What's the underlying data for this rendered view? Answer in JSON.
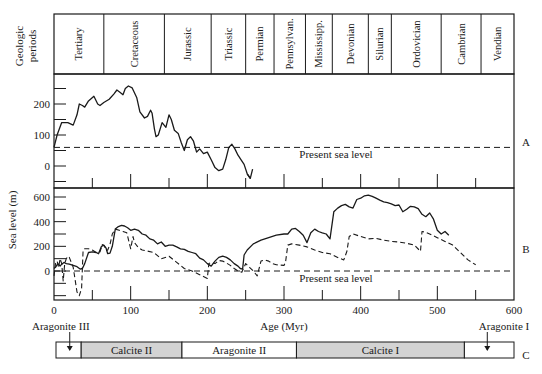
{
  "chart_data": {
    "type": "line",
    "title": "",
    "periods_header": {
      "label_line1": "Geologic",
      "label_line2": "periods",
      "periods": [
        {
          "name": "Tertiary",
          "start": 0,
          "end": 65
        },
        {
          "name": "Cretaceous",
          "start": 65,
          "end": 144
        },
        {
          "name": "Jurassic",
          "start": 144,
          "end": 205
        },
        {
          "name": "Triassic",
          "start": 205,
          "end": 250
        },
        {
          "name": "Permian",
          "start": 250,
          "end": 287
        },
        {
          "name": "Pennsylvan.",
          "start": 287,
          "end": 328
        },
        {
          "name": "Mississipp.",
          "start": 328,
          "end": 363
        },
        {
          "name": "Devonian",
          "start": 363,
          "end": 410
        },
        {
          "name": "Silurian",
          "start": 410,
          "end": 440
        },
        {
          "name": "Ordovician",
          "start": 440,
          "end": 505
        },
        {
          "name": "Cambrian",
          "start": 505,
          "end": 557
        },
        {
          "name": "Vendian",
          "start": 557,
          "end": 600
        }
      ]
    },
    "xlabel": "Age (Myr)",
    "xlim": [
      0,
      600
    ],
    "xticks": [
      0,
      100,
      200,
      300,
      400,
      500,
      600
    ],
    "ylabel": "Sea level (m)",
    "panels": [
      {
        "id": "A",
        "ylim": [
          -60,
          300
        ],
        "yticks": [
          0,
          100,
          200
        ],
        "reference_label": "Present sea level",
        "reference_value": 60,
        "series": [
          {
            "name": "Sea level A",
            "style": "solid",
            "x": [
              0,
              4,
              10,
              18,
              25,
              30,
              33,
              37,
              40,
              45,
              52,
              57,
              60,
              65,
              72,
              78,
              82,
              86,
              90,
              93,
              97,
              102,
              108,
              112,
              118,
              122,
              126,
              128,
              131,
              133,
              136,
              141,
              146,
              150,
              153,
              157,
              162,
              166,
              170,
              174,
              178,
              182,
              186,
              190,
              195,
              200,
              205,
              210,
              215,
              220,
              224,
              228,
              232,
              236,
              240,
              244,
              248,
              252,
              256
            ],
            "y": [
              60,
              100,
              140,
              140,
              132,
              165,
              200,
              195,
              190,
              210,
              225,
              200,
              195,
              205,
              215,
              232,
              245,
              238,
              230,
              250,
              258,
              252,
              220,
              175,
              155,
              160,
              180,
              170,
              120,
              95,
              100,
              140,
              125,
              165,
              150,
              115,
              105,
              75,
              50,
              85,
              95,
              80,
              45,
              55,
              40,
              45,
              20,
              -5,
              -15,
              -10,
              20,
              60,
              70,
              55,
              35,
              20,
              5,
              -25,
              -40
            ]
          }
        ],
        "tail": {
          "x": [
            252,
            256,
            259
          ],
          "y": [
            -25,
            -40,
            -10
          ]
        }
      },
      {
        "id": "B",
        "ylim": [
          -240,
          660
        ],
        "yticks": [
          0,
          200,
          400,
          600
        ],
        "reference_label": "Present sea level",
        "reference_value": 0,
        "series": [
          {
            "name": "Sea level B (solid)",
            "style": "solid",
            "x": [
              0,
              2,
              5,
              8,
              10,
              13,
              16,
              20,
              25,
              30,
              34,
              37,
              40,
              45,
              50,
              55,
              58,
              62,
              65,
              68,
              70,
              73,
              76,
              80,
              84,
              88,
              92,
              96,
              100,
              105,
              110,
              115,
              120,
              125,
              130,
              135,
              140,
              145,
              150,
              155,
              160,
              165,
              170,
              175,
              180,
              185,
              190,
              195,
              200,
              205,
              210,
              215,
              220,
              225,
              230,
              235,
              240,
              243,
              246,
              248,
              252,
              260,
              270,
              280,
              290,
              300,
              305,
              310,
              315,
              320,
              325,
              330,
              335,
              340,
              345,
              350,
              355,
              360,
              365,
              370,
              375,
              380,
              385,
              390,
              395,
              400,
              405,
              410,
              415,
              420,
              425,
              430,
              435,
              440,
              445,
              450,
              455,
              460,
              465,
              470,
              475,
              480,
              485,
              490,
              495,
              500,
              505,
              510,
              515,
              520,
              525,
              530,
              535,
              540,
              545,
              550
            ],
            "y": [
              20,
              30,
              60,
              40,
              55,
              70,
              60,
              55,
              45,
              35,
              15,
              20,
              60,
              150,
              155,
              150,
              140,
              200,
              210,
              185,
              140,
              145,
              200,
              340,
              360,
              370,
              365,
              350,
              330,
              340,
              330,
              300,
              290,
              260,
              250,
              220,
              235,
              200,
              210,
              210,
              195,
              180,
              175,
              160,
              150,
              140,
              105,
              90,
              60,
              40,
              80,
              110,
              120,
              110,
              90,
              60,
              40,
              20,
              15,
              130,
              170,
              220,
              250,
              270,
              290,
              300,
              300,
              340,
              345,
              320,
              290,
              230,
              310,
              340,
              320,
              310,
              300,
              260,
              480,
              510,
              530,
              540,
              520,
              510,
              580,
              590,
              610,
              615,
              605,
              590,
              575,
              560,
              555,
              545,
              530,
              535,
              480,
              500,
              525,
              520,
              505,
              460,
              440,
              470,
              420,
              330,
              300,
              320,
              290
            ]
          },
          {
            "name": "Sea level B (dashed)",
            "style": "dashed",
            "x": [
              0,
              2,
              4,
              6,
              8,
              10,
              12,
              14,
              16,
              18,
              20,
              25,
              30,
              33,
              36,
              38,
              40,
              45,
              50,
              55,
              60,
              63,
              66,
              68,
              70,
              73,
              76,
              80,
              85,
              90,
              95,
              100,
              103,
              105,
              110,
              115,
              120,
              130,
              140,
              150,
              160,
              170,
              180,
              190,
              200,
              202,
              205,
              210,
              215,
              220,
              225,
              230,
              235,
              240,
              245,
              250,
              255,
              260,
              265,
              270,
              275,
              280,
              285,
              290,
              300,
              302,
              305,
              310,
              320,
              330,
              340,
              350,
              360,
              370,
              378,
              382,
              385,
              390,
              400,
              410,
              420,
              430,
              440,
              450,
              460,
              470,
              478,
              480,
              485,
              490,
              500,
              510,
              520,
              530,
              540,
              550
            ],
            "y": [
              -40,
              60,
              80,
              30,
              100,
              60,
              -80,
              60,
              100,
              120,
              110,
              30,
              -170,
              -200,
              -140,
              170,
              180,
              180,
              170,
              150,
              155,
              215,
              200,
              165,
              170,
              215,
              300,
              340,
              330,
              320,
              310,
              180,
              280,
              230,
              190,
              170,
              165,
              150,
              100,
              120,
              70,
              20,
              0,
              -30,
              -60,
              60,
              70,
              60,
              85,
              80,
              65,
              45,
              20,
              0,
              -10,
              60,
              30,
              0,
              -40,
              80,
              90,
              80,
              60,
              50,
              45,
              70,
              210,
              220,
              210,
              195,
              170,
              150,
              140,
              110,
              90,
              160,
              280,
              300,
              280,
              260,
              265,
              250,
              240,
              235,
              225,
              210,
              160,
              320,
              315,
              300,
              270,
              240,
              210,
              150,
              90,
              50
            ]
          }
        ]
      }
    ],
    "mineralogy_bar": {
      "id": "C",
      "segments": [
        {
          "name": "",
          "start": 0,
          "end": 33,
          "shaded": false
        },
        {
          "name": "Calcite II",
          "start": 33,
          "end": 165,
          "shaded": true
        },
        {
          "name": "Aragonite II",
          "start": 165,
          "end": 315,
          "shaded": false
        },
        {
          "name": "Calcite I",
          "start": 315,
          "end": 535,
          "shaded": true
        },
        {
          "name": "",
          "start": 535,
          "end": 600,
          "shaded": false
        }
      ],
      "markers": [
        {
          "label": "Aragonite III",
          "age": 18
        },
        {
          "label": "Aragonite I",
          "age": 565
        }
      ]
    },
    "panel_labels": [
      "A",
      "B",
      "C"
    ],
    "grid": false,
    "legend": "none"
  },
  "colors": {
    "ink": "#1a1a1a",
    "shade": "#d3d3d3",
    "background": "#ffffff"
  }
}
